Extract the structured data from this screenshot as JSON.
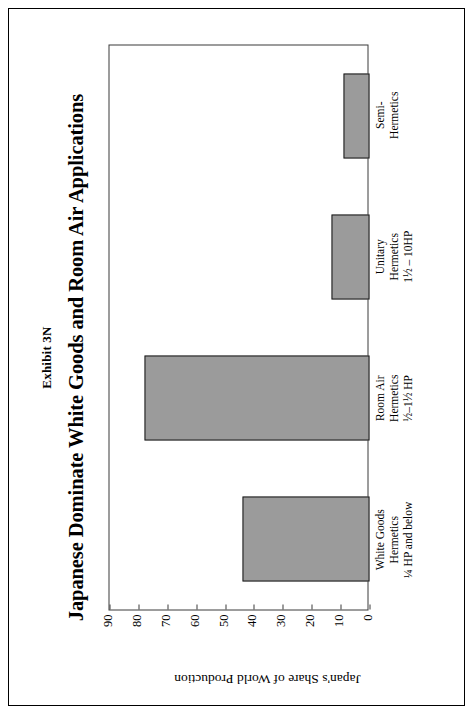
{
  "exhibit": {
    "number": "Exhibit 3N",
    "title": "Japanese Dominate White Goods and Room Air Applications"
  },
  "chart_data": {
    "type": "bar",
    "title": "Japanese Dominate White Goods and Room Air Applications",
    "xlabel": "",
    "ylabel": "Japan's Share of World Production",
    "ylim": [
      0,
      90
    ],
    "ytick_step": 10,
    "yticks": [
      0,
      10,
      20,
      30,
      40,
      50,
      60,
      70,
      80,
      90
    ],
    "grid": false,
    "legend": "none",
    "bar_fill_color": "#9b9b9b",
    "bar_edge_color": "#1a1a1a",
    "plot_border_color": "#3a3a3a",
    "categories": [
      "White Goods Hermetics 1/4 HP and below",
      "Room Air Hermetics 1/2-1 1/2 HP",
      "Unitary Hermetics 1 1/2 - 10HP",
      "Semi-Hermetics"
    ],
    "category_lines": [
      [
        "White Goods",
        "Hermetics",
        "¼ HP and below"
      ],
      [
        "Room Air",
        "Hermetics",
        "½–1½ HP"
      ],
      [
        "Unitary",
        "Hermetics",
        "1½ – 10HP"
      ],
      [
        "Semi-",
        "Hermetics",
        ""
      ]
    ],
    "values": [
      44,
      78,
      13,
      9
    ]
  }
}
